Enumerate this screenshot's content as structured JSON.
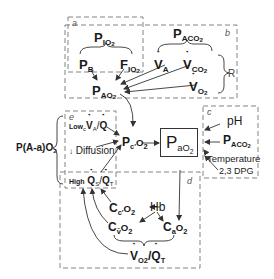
{
  "diagram": {
    "boxes": {
      "a": "a",
      "b": "b",
      "c": "c",
      "d": "d",
      "e": "e"
    },
    "nodes": {
      "pio2": {
        "main": "P",
        "sub": "IO",
        "sub2": "2"
      },
      "pb": {
        "main": "P",
        "sub": "B"
      },
      "fio2": {
        "main": "F",
        "sub": "IO",
        "sub2": "2"
      },
      "pao2_alv": {
        "main": "P",
        "sub": "AO",
        "sub2": "2"
      },
      "paco2": {
        "main": "P",
        "sub": "ACO",
        "sub2": "2"
      },
      "va": {
        "main": "V",
        "sub": "A"
      },
      "vco2": {
        "main": "V",
        "sub": "CO",
        "sub2": "2"
      },
      "vo2": {
        "main": "V",
        "sub": "O",
        "sub2": "2"
      },
      "r": "R",
      "pcprime": {
        "main": "P",
        "sub": "c'",
        "rest": "O",
        "sub2": "2"
      },
      "pa_o2_art": {
        "main": "P",
        "sub": "aO",
        "sub2": "2"
      },
      "ph": "pH",
      "paco2_art": {
        "main": "P",
        "sub": "ACO",
        "sub2": "2"
      },
      "temperature": "Temperature",
      "dpg": "2,3 DPG",
      "aa_gradient": {
        "text": "P(A-a)O",
        "sub2": "2"
      },
      "low_va_q": {
        "prefix": "Low",
        "sub": "c",
        "text": "V",
        "sub_a": "A",
        "slash": "/",
        "q": "Q"
      },
      "diffusion": {
        "arrow": "↓",
        "text": "Diffusion"
      },
      "high_qs_qt": {
        "prefix": "High",
        "q1": "Q",
        "s": "S",
        "slash": "/",
        "q2": "Q",
        "t": "T"
      },
      "cc_o2": {
        "main": "C",
        "sub": "c'",
        "rest": "O",
        "sub2": "2"
      },
      "hb": "Hb",
      "cvo2": {
        "main": "C",
        "sub": "v̄",
        "rest": "O",
        "sub2": "2"
      },
      "cao2": {
        "main": "C",
        "sub": "a",
        "rest": "O",
        "sub2": "2"
      },
      "vo2_qt": {
        "v": "V",
        "o2": "O2",
        "slash": "/",
        "q": "Q",
        "t": "T"
      }
    },
    "colors": {
      "line": "#333333",
      "dashed": "#777777",
      "text": "#1a1a1a"
    }
  }
}
